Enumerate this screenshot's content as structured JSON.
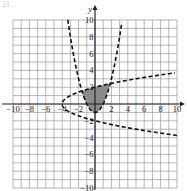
{
  "problem_label": "21.",
  "chart_data": {
    "type": "line",
    "title": "",
    "xlabel": "x",
    "ylabel": "y",
    "xlim": [
      -10,
      10
    ],
    "ylim": [
      -10,
      10
    ],
    "grid": true,
    "grid_step": 1,
    "x_ticks": [
      -10,
      -8,
      -6,
      -4,
      -2,
      2,
      4,
      6,
      8,
      10
    ],
    "y_ticks": [
      -10,
      -8,
      -6,
      -4,
      -2,
      2,
      4,
      6,
      8,
      10
    ],
    "x_tick_labels": [
      "−10",
      "−8",
      "−6",
      "−4",
      "−2",
      "2",
      "4",
      "6",
      "8",
      "10"
    ],
    "y_tick_labels": [
      "−10",
      "−8",
      "−6",
      "−4",
      "−2",
      "2",
      "4",
      "6",
      "8",
      "10"
    ],
    "series": [
      {
        "name": "y = x^2 - 1",
        "style": "dashed",
        "kind": "parabola-vertical",
        "vertex": [
          0,
          -1
        ]
      },
      {
        "name": "x = y^2 - 4",
        "style": "dashed",
        "kind": "parabola-horizontal",
        "vertex": [
          -4,
          0
        ]
      }
    ],
    "shaded_region": {
      "description": "region where y > x^2 - 1 and x > y^2 - 4",
      "fill": "#8a8a8a",
      "approx_vertices_bounds": {
        "x": [
          -1.6,
          1.7
        ],
        "y": [
          -1,
          1.9
        ]
      }
    },
    "colors": {
      "grid": "#9a9a9a",
      "axis": "#222222",
      "curve": "#111111",
      "shade": "#8a8a8a"
    }
  }
}
